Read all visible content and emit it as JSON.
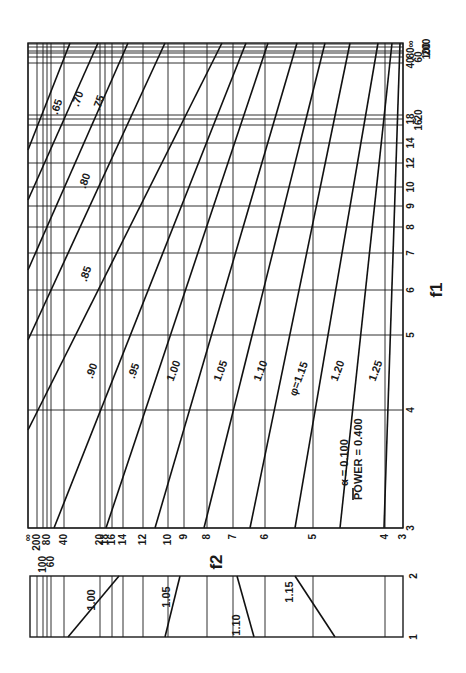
{
  "chart_data": {
    "type": "line",
    "orientation_note": "figure rotated 90 degrees; f2 runs along the bottom axis, f1 along the right axis",
    "xlabel": "f2",
    "ylabel": "f1",
    "legend": {
      "alpha_label": "α = 0.100",
      "power_label": "POWER = 0.400"
    },
    "f2_ticks": [
      {
        "label": "∞",
        "x": 28
      },
      {
        "label": "200",
        "x": 37
      },
      {
        "label": "100",
        "x": 43
      },
      {
        "label": "80",
        "x": 47
      },
      {
        "label": "60",
        "x": 51
      },
      {
        "label": "40",
        "x": 64
      },
      {
        "label": "20",
        "x": 100
      },
      {
        "label": "18",
        "x": 105
      },
      {
        "label": "16",
        "x": 112
      },
      {
        "label": "14",
        "x": 123
      },
      {
        "label": "12",
        "x": 143
      },
      {
        "label": "10",
        "x": 168
      },
      {
        "label": "9",
        "x": 184
      },
      {
        "label": "8",
        "x": 207
      },
      {
        "label": "7",
        "x": 233
      },
      {
        "label": "6",
        "x": 265
      },
      {
        "label": "5",
        "x": 313
      },
      {
        "label": "4",
        "x": 385
      },
      {
        "label": "3",
        "x": 403
      }
    ],
    "f1_ticks": [
      {
        "label": "∞",
        "y": 44
      },
      {
        "label": "200",
        "y": 47
      },
      {
        "label": "100",
        "y": 51
      },
      {
        "label": "80",
        "y": 53
      },
      {
        "label": "60",
        "y": 57
      },
      {
        "label": "40",
        "y": 63
      },
      {
        "label": "20",
        "y": 115
      },
      {
        "label": "18",
        "y": 119
      },
      {
        "label": "16",
        "y": 125
      },
      {
        "label": "14",
        "y": 143
      },
      {
        "label": "12",
        "y": 163
      },
      {
        "label": "10",
        "y": 187
      },
      {
        "label": "9",
        "y": 206
      },
      {
        "label": "8",
        "y": 227
      },
      {
        "label": "7",
        "y": 253
      },
      {
        "label": "6",
        "y": 290
      },
      {
        "label": "5",
        "y": 335
      },
      {
        "label": "4",
        "y": 410
      },
      {
        "label": "3",
        "y": 528
      }
    ],
    "phi_curves": [
      {
        "phi": ".65",
        "x1": 28,
        "y1": 150,
        "x2": 70,
        "y2": 43,
        "label_x": 56,
        "label_y": 108
      },
      {
        "phi": ".70",
        "x1": 28,
        "y1": 200,
        "x2": 98,
        "y2": 43,
        "label_x": 77,
        "label_y": 100
      },
      {
        "phi": ".75",
        "x1": 28,
        "y1": 270,
        "x2": 128,
        "y2": 43,
        "label_x": 98,
        "label_y": 104
      },
      {
        "phi": ".80",
        "x1": 28,
        "y1": 340,
        "x2": 165,
        "y2": 43,
        "label_x": 84,
        "label_y": 182
      },
      {
        "phi": ".85",
        "x1": 28,
        "y1": 430,
        "x2": 222,
        "y2": 43,
        "label_x": 85,
        "label_y": 275
      },
      {
        "phi": ".90",
        "x1": 54,
        "y1": 528,
        "x2": 246,
        "y2": 43,
        "label_x": 91,
        "label_y": 372
      },
      {
        "phi": ".95",
        "x1": 106,
        "y1": 528,
        "x2": 268,
        "y2": 43,
        "label_x": 133,
        "label_y": 372
      },
      {
        "phi": "1.00",
        "x1": 155,
        "y1": 528,
        "x2": 297,
        "y2": 43,
        "label_x": 173,
        "label_y": 372
      },
      {
        "phi": "1.05",
        "x1": 204,
        "y1": 528,
        "x2": 325,
        "y2": 43,
        "label_x": 220,
        "label_y": 372
      },
      {
        "phi": "1.10",
        "x1": 250,
        "y1": 528,
        "x2": 350,
        "y2": 43,
        "label_x": 260,
        "label_y": 372
      },
      {
        "phi": "φ=1.15",
        "x1": 295,
        "y1": 528,
        "x2": 378,
        "y2": 43,
        "label_x": 298,
        "label_y": 380
      },
      {
        "phi": "1.20",
        "x1": 340,
        "y1": 528,
        "x2": 392,
        "y2": 43,
        "label_x": 337,
        "label_y": 372
      },
      {
        "phi": "1.25",
        "x1": 384,
        "y1": 528,
        "x2": 400,
        "y2": 43,
        "label_x": 375,
        "label_y": 372
      }
    ],
    "inset": {
      "f1_range": [
        "1",
        "2"
      ],
      "curves": [
        {
          "phi": "1.00",
          "x1": 68,
          "y1": 637,
          "x2": 119,
          "y2": 576,
          "label_x": 95,
          "label_y": 600
        },
        {
          "phi": "1.05",
          "x1": 165,
          "y1": 637,
          "x2": 180,
          "y2": 576,
          "label_x": 170,
          "label_y": 597
        },
        {
          "phi": "1.10",
          "x1": 254,
          "y1": 637,
          "x2": 237,
          "y2": 576,
          "label_x": 240,
          "label_y": 625
        },
        {
          "phi": "1.15",
          "x1": 335,
          "y1": 637,
          "x2": 295,
          "y2": 576,
          "label_x": 293,
          "label_y": 592
        }
      ],
      "grid_x": [
        37,
        43,
        47,
        51,
        64,
        100,
        112,
        123,
        143,
        168,
        207,
        233,
        265,
        313,
        385
      ]
    }
  }
}
